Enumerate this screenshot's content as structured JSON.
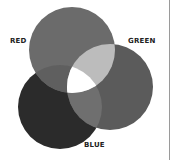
{
  "diagram": {
    "type": "venn",
    "circles": [
      {
        "name": "red",
        "label": "RED",
        "cx": 72,
        "cy": 50,
        "r": 43,
        "fill": "#6b6b6b"
      },
      {
        "name": "green",
        "label": "GREEN",
        "cx": 110,
        "cy": 87,
        "r": 43,
        "fill": "#5b5b5b"
      },
      {
        "name": "blue",
        "label": "BLUE",
        "cx": 60,
        "cy": 107,
        "r": 42,
        "fill": "#2b2b2b"
      }
    ],
    "overlaps": {
      "red_green": "#bcbcbc",
      "red_blue": "#5f5f5f",
      "green_blue": "#6f6f6f",
      "all": "#ffffff"
    },
    "labels": {
      "red": "RED",
      "green": "GREEN",
      "blue": "BLUE"
    }
  }
}
